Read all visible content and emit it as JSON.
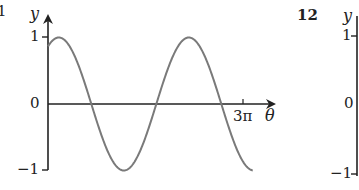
{
  "left_panel": {
    "question_fragment": "1",
    "ylabel": "y",
    "xlabel": "θ",
    "yticks": [
      "1",
      "0",
      "−1"
    ],
    "xtick": "3π"
  },
  "right_panel": {
    "question_number": "12",
    "ylabel": "y",
    "yticks": [
      "1",
      "0",
      "−1"
    ]
  },
  "colors": {
    "axis": "#222222",
    "curve": "#7a7a7a"
  },
  "chart_data": [
    {
      "type": "line",
      "title": "",
      "xlabel": "θ",
      "ylabel": "y",
      "x_ticks": [
        "3π"
      ],
      "y_ticks": [
        -1,
        0,
        1
      ],
      "xlim": [
        0,
        3.4
      ],
      "ylim": [
        -1,
        1
      ],
      "x_unit": "π",
      "grid": false,
      "legend": null,
      "series": [
        {
          "name": "y = sin(θ + π/3) (approx.)",
          "x": [
            0,
            0.17,
            0.5,
            0.67,
            1.0,
            1.17,
            1.5,
            1.67,
            2.0,
            2.17,
            2.5,
            2.67,
            3.0,
            3.15
          ],
          "values": [
            0.87,
            1.0,
            0.5,
            0.0,
            -0.87,
            -1.0,
            -0.5,
            0.0,
            0.87,
            1.0,
            0.5,
            0.0,
            -0.87,
            -0.95
          ]
        }
      ]
    },
    {
      "type": "line",
      "title": "",
      "xlabel": "",
      "ylabel": "y",
      "y_ticks": [
        -1,
        0,
        1
      ],
      "series": []
    }
  ]
}
